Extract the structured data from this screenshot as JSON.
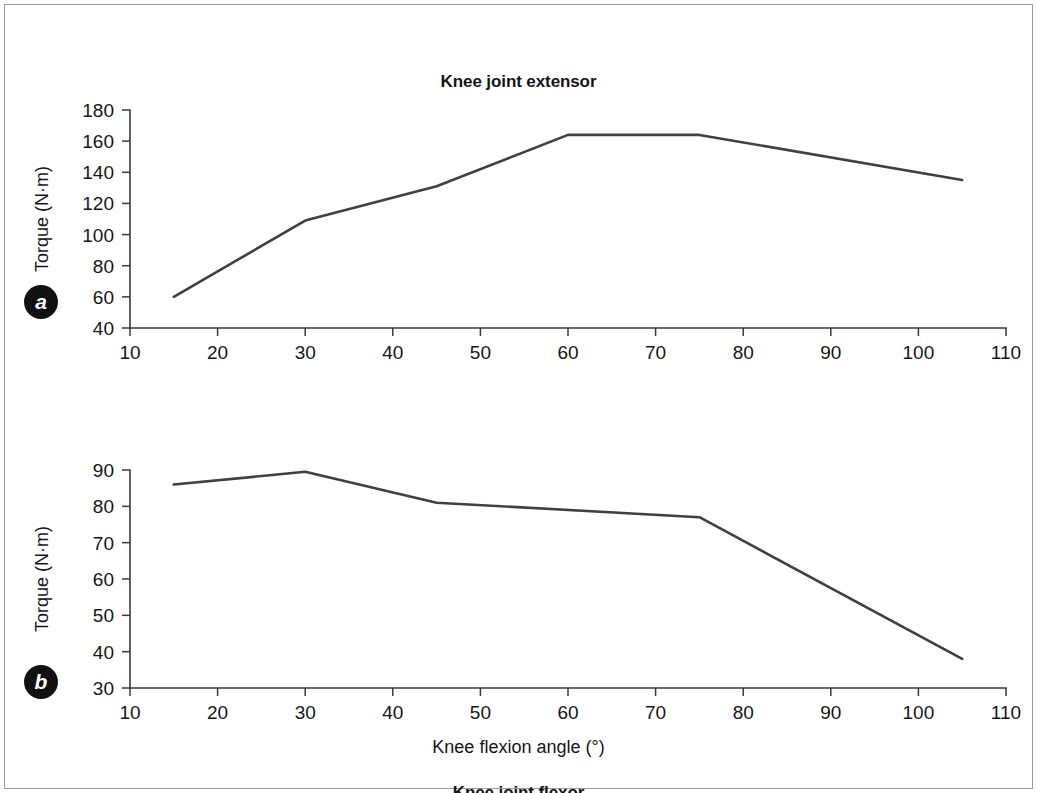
{
  "figure": {
    "x_axis_caption": "Knee flexion angle (°)",
    "panels": [
      {
        "badge": "a",
        "title": "Knee joint extensor"
      },
      {
        "badge": "b",
        "title": "Knee joint flexor"
      }
    ]
  },
  "chart_data": [
    {
      "type": "line",
      "panel": "a",
      "title": "Knee joint extensor",
      "xlabel": "Knee flexion angle (°)",
      "ylabel": "Torque (N·m)",
      "xlim": [
        10,
        110
      ],
      "ylim": [
        40,
        180
      ],
      "xticks": [
        10,
        20,
        30,
        40,
        50,
        60,
        70,
        80,
        90,
        100,
        110
      ],
      "yticks": [
        40,
        60,
        80,
        100,
        120,
        140,
        160,
        180
      ],
      "grid": false,
      "legend": "none",
      "series": [
        {
          "name": "Knee joint extensor torque",
          "x": [
            15,
            30,
            45,
            60,
            75,
            105
          ],
          "values": [
            60,
            109,
            131,
            164,
            164,
            135
          ]
        }
      ]
    },
    {
      "type": "line",
      "panel": "b",
      "title": "Knee joint flexor",
      "xlabel": "Knee flexion angle (°)",
      "ylabel": "Torque (N·m)",
      "xlim": [
        10,
        110
      ],
      "ylim": [
        30,
        90
      ],
      "xticks": [
        10,
        20,
        30,
        40,
        50,
        60,
        70,
        80,
        90,
        100,
        110
      ],
      "yticks": [
        30,
        40,
        50,
        60,
        70,
        80,
        90
      ],
      "grid": false,
      "legend": "none",
      "series": [
        {
          "name": "Knee joint flexor torque",
          "x": [
            15,
            30,
            45,
            75,
            105
          ],
          "values": [
            86,
            89.5,
            81,
            77,
            38
          ]
        }
      ]
    }
  ],
  "colors": {
    "line": "#404040",
    "axis": "#3a3a3a",
    "text": "#161616",
    "badge_bg": "#111111",
    "badge_fg": "#ffffff",
    "frame": "#9a9a9a"
  }
}
